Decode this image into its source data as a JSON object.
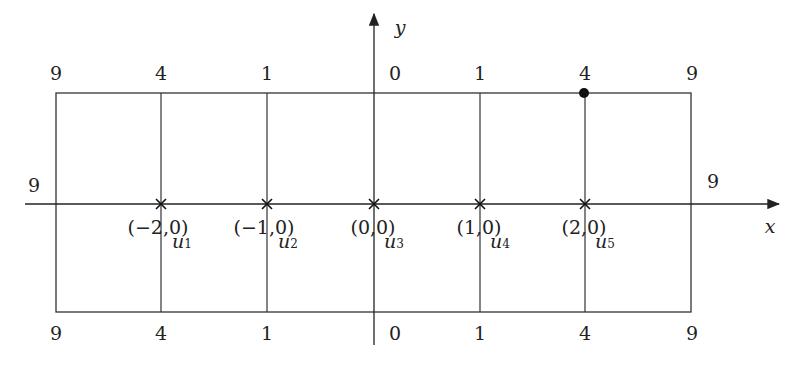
{
  "axes": {
    "x_label": "x",
    "y_label": "y"
  },
  "top_values": [
    "9",
    "4",
    "1",
    "0",
    "1",
    "4",
    "9"
  ],
  "bottom_values": [
    "9",
    "4",
    "1",
    "0",
    "1",
    "4",
    "9"
  ],
  "side_values": {
    "left": "9",
    "right": "9"
  },
  "points": [
    {
      "coord": "(−2,0)",
      "name": "u",
      "index": "1"
    },
    {
      "coord": "(−1,0)",
      "name": "u",
      "index": "2"
    },
    {
      "coord": "(0,0)",
      "name": "u",
      "index": "3"
    },
    {
      "coord": "(1,0)",
      "name": "u",
      "index": "4"
    },
    {
      "coord": "(2,0)",
      "name": "u",
      "index": "5"
    }
  ],
  "highlight_point": {
    "column": 5,
    "edge": "top"
  }
}
